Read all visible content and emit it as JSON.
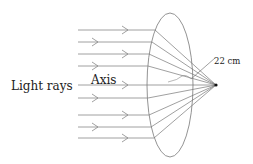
{
  "diagram": {
    "type": "convex lens focusing parallel light rays",
    "labels": {
      "light_rays": "Light rays",
      "axis": "Axis",
      "focal_length": "22 cm"
    },
    "colors": {
      "line": "#777777",
      "text": "#222222",
      "focus": "#111111"
    },
    "ray_count": 9
  }
}
